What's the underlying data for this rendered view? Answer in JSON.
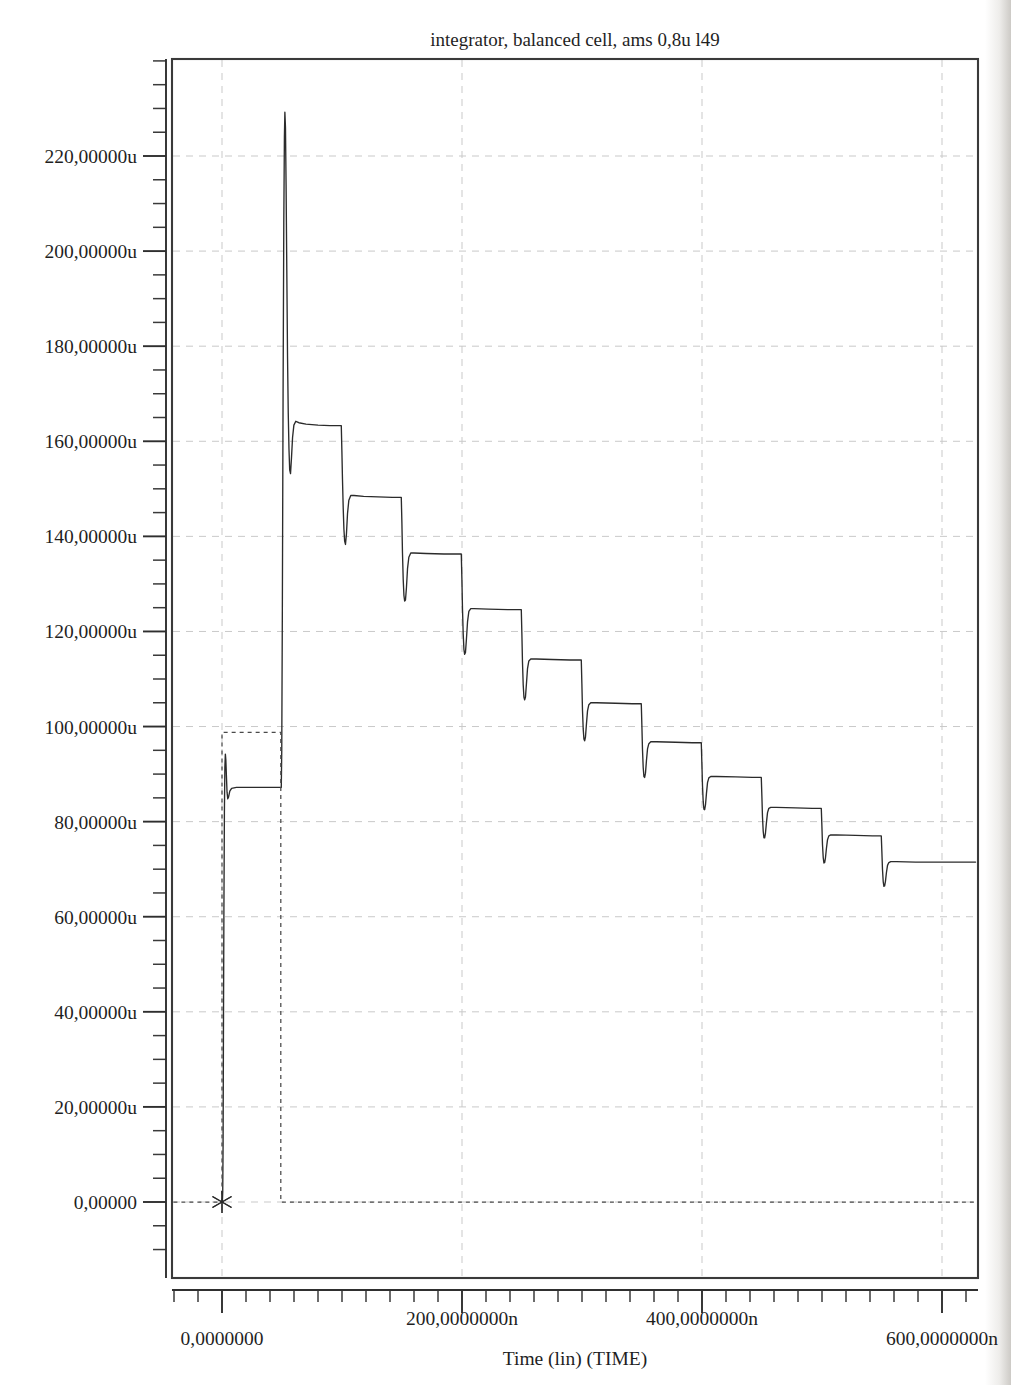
{
  "chart_data": {
    "type": "line",
    "title": "integrator, balanced cell,  ams 0,8u l49",
    "xlabel": "Time (lin) (TIME)",
    "ylabel": "",
    "xlim": [
      -42,
      630
    ],
    "ylim": [
      -14,
      243
    ],
    "x_unit": "n",
    "y_unit": "u",
    "grid": true,
    "legend": "none",
    "xticks": [
      0,
      200,
      400,
      600
    ],
    "xtick_labels": [
      "0,0000000",
      "200,0000000n",
      "400,0000000n",
      "600,0000000n"
    ],
    "x_minor_tick_step": 20,
    "yticks": [
      0,
      20,
      40,
      60,
      80,
      100,
      120,
      140,
      160,
      180,
      200,
      220
    ],
    "ytick_labels": [
      "0,00000",
      "20,00000u",
      "40,00000u",
      "60,00000u",
      "80,00000u",
      "100,00000u",
      "120,00000u",
      "140,00000u",
      "160,00000u",
      "180,00000u",
      "200,00000u",
      "220,00000u"
    ],
    "y_minor_tick_step": 5,
    "series": [
      {
        "name": "integrator-output",
        "style": "solid",
        "color": "#2b2b2b",
        "points": [
          [
            0,
            0
          ],
          [
            0,
            0
          ],
          [
            0.3,
            0.0
          ],
          [
            0.6,
            2.0
          ],
          [
            0.9,
            12.0
          ],
          [
            1.2,
            35.0
          ],
          [
            1.6,
            62.0
          ],
          [
            2.0,
            82.0
          ],
          [
            2.4,
            91.5
          ],
          [
            2.8,
            94.2
          ],
          [
            3.2,
            93.0
          ],
          [
            3.7,
            89.5
          ],
          [
            4.2,
            86.2
          ],
          [
            4.8,
            84.8
          ],
          [
            5.5,
            85.2
          ],
          [
            6.5,
            86.4
          ],
          [
            8.0,
            87.0
          ],
          [
            12.0,
            87.2
          ],
          [
            20.0,
            87.2
          ],
          [
            30.0,
            87.2
          ],
          [
            40.0,
            87.2
          ],
          [
            48.0,
            87.2
          ],
          [
            49.0,
            87.2
          ],
          [
            49.4,
            87.2
          ],
          [
            49.8,
            95.0
          ],
          [
            50.3,
            125.0
          ],
          [
            50.9,
            170.0
          ],
          [
            51.5,
            206.0
          ],
          [
            52.0,
            224.0
          ],
          [
            52.4,
            229.2
          ],
          [
            52.9,
            226.0
          ],
          [
            53.4,
            214.0
          ],
          [
            54.0,
            196.0
          ],
          [
            54.6,
            178.0
          ],
          [
            55.2,
            166.0
          ],
          [
            55.8,
            158.5
          ],
          [
            56.4,
            154.0
          ],
          [
            57.1,
            153.2
          ],
          [
            57.9,
            156.5
          ],
          [
            58.8,
            160.8
          ],
          [
            59.9,
            163.4
          ],
          [
            61.5,
            164.2
          ],
          [
            64.0,
            163.9
          ],
          [
            70.0,
            163.6
          ],
          [
            80.0,
            163.4
          ],
          [
            90.0,
            163.3
          ],
          [
            98.0,
            163.3
          ],
          [
            99.0,
            163.3
          ],
          [
            99.4,
            163.3
          ],
          [
            99.9,
            158.0
          ],
          [
            100.4,
            152.0
          ],
          [
            101.0,
            146.0
          ],
          [
            101.6,
            141.5
          ],
          [
            102.2,
            139.0
          ],
          [
            102.9,
            138.3
          ],
          [
            103.7,
            140.5
          ],
          [
            104.6,
            144.8
          ],
          [
            105.7,
            147.6
          ],
          [
            107.3,
            148.6
          ],
          [
            110.0,
            148.6
          ],
          [
            118.0,
            148.4
          ],
          [
            130.0,
            148.3
          ],
          [
            142.0,
            148.2
          ],
          [
            148.0,
            148.2
          ],
          [
            149.0,
            148.2
          ],
          [
            149.4,
            148.2
          ],
          [
            149.9,
            143.0
          ],
          [
            150.4,
            136.5
          ],
          [
            151.0,
            131.0
          ],
          [
            151.6,
            127.6
          ],
          [
            152.2,
            126.4
          ],
          [
            152.9,
            126.6
          ],
          [
            153.7,
            129.2
          ],
          [
            154.6,
            133.2
          ],
          [
            155.7,
            135.6
          ],
          [
            157.3,
            136.5
          ],
          [
            160.0,
            136.5
          ],
          [
            170.0,
            136.4
          ],
          [
            185.0,
            136.3
          ],
          [
            196.0,
            136.3
          ],
          [
            198.0,
            136.3
          ],
          [
            199.0,
            136.3
          ],
          [
            199.4,
            136.3
          ],
          [
            199.9,
            131.2
          ],
          [
            200.4,
            124.8
          ],
          [
            201.0,
            119.5
          ],
          [
            201.6,
            116.2
          ],
          [
            202.2,
            115.2
          ],
          [
            202.9,
            115.6
          ],
          [
            203.7,
            118.4
          ],
          [
            204.6,
            122.0
          ],
          [
            205.7,
            124.2
          ],
          [
            207.3,
            124.8
          ],
          [
            210.0,
            124.8
          ],
          [
            222.0,
            124.7
          ],
          [
            238.0,
            124.6
          ],
          [
            246.0,
            124.6
          ],
          [
            249.0,
            124.6
          ],
          [
            249.4,
            124.6
          ],
          [
            249.9,
            119.5
          ],
          [
            250.4,
            113.5
          ],
          [
            251.0,
            108.8
          ],
          [
            251.6,
            106.2
          ],
          [
            252.2,
            105.6
          ],
          [
            252.9,
            106.2
          ],
          [
            253.7,
            109.0
          ],
          [
            254.6,
            112.2
          ],
          [
            255.7,
            113.8
          ],
          [
            257.3,
            114.2
          ],
          [
            262.0,
            114.2
          ],
          [
            275.0,
            114.1
          ],
          [
            290.0,
            114.0
          ],
          [
            297.0,
            114.0
          ],
          [
            299.0,
            114.0
          ],
          [
            299.4,
            114.0
          ],
          [
            299.9,
            109.0
          ],
          [
            300.4,
            103.5
          ],
          [
            301.0,
            99.5
          ],
          [
            301.6,
            97.4
          ],
          [
            302.2,
            97.0
          ],
          [
            302.9,
            97.8
          ],
          [
            303.7,
            100.5
          ],
          [
            304.6,
            103.3
          ],
          [
            305.7,
            104.6
          ],
          [
            307.3,
            105.0
          ],
          [
            312.0,
            105.0
          ],
          [
            328.0,
            104.9
          ],
          [
            342.0,
            104.8
          ],
          [
            348.0,
            104.8
          ],
          [
            349.0,
            104.8
          ],
          [
            349.4,
            104.8
          ],
          [
            349.9,
            100.2
          ],
          [
            350.4,
            95.2
          ],
          [
            351.0,
            91.4
          ],
          [
            351.6,
            89.5
          ],
          [
            352.2,
            89.3
          ],
          [
            352.9,
            90.2
          ],
          [
            353.7,
            92.8
          ],
          [
            354.6,
            95.3
          ],
          [
            355.7,
            96.4
          ],
          [
            357.3,
            96.8
          ],
          [
            362.0,
            96.8
          ],
          [
            378.0,
            96.7
          ],
          [
            392.0,
            96.6
          ],
          [
            398.0,
            96.6
          ],
          [
            399.0,
            96.6
          ],
          [
            399.4,
            96.6
          ],
          [
            399.9,
            92.3
          ],
          [
            400.4,
            87.6
          ],
          [
            401.0,
            84.2
          ],
          [
            401.6,
            82.6
          ],
          [
            402.2,
            82.5
          ],
          [
            402.9,
            83.5
          ],
          [
            403.7,
            85.9
          ],
          [
            404.6,
            88.2
          ],
          [
            405.7,
            89.2
          ],
          [
            407.3,
            89.5
          ],
          [
            412.0,
            89.5
          ],
          [
            428.0,
            89.4
          ],
          [
            442.0,
            89.3
          ],
          [
            448.0,
            89.3
          ],
          [
            449.0,
            89.3
          ],
          [
            449.4,
            89.3
          ],
          [
            449.9,
            85.4
          ],
          [
            450.4,
            81.0
          ],
          [
            451.0,
            78.0
          ],
          [
            451.6,
            76.6
          ],
          [
            452.2,
            76.6
          ],
          [
            452.9,
            77.6
          ],
          [
            453.7,
            79.8
          ],
          [
            454.6,
            81.9
          ],
          [
            455.7,
            82.8
          ],
          [
            457.3,
            83.0
          ],
          [
            462.0,
            83.0
          ],
          [
            478.0,
            82.9
          ],
          [
            492.0,
            82.8
          ],
          [
            498.0,
            82.8
          ],
          [
            499.0,
            82.8
          ],
          [
            499.4,
            82.8
          ],
          [
            499.9,
            79.2
          ],
          [
            500.4,
            75.2
          ],
          [
            501.0,
            72.5
          ],
          [
            501.6,
            71.3
          ],
          [
            502.2,
            71.4
          ],
          [
            502.9,
            72.4
          ],
          [
            503.7,
            74.4
          ],
          [
            504.6,
            76.2
          ],
          [
            505.7,
            77.0
          ],
          [
            507.3,
            77.2
          ],
          [
            512.0,
            77.2
          ],
          [
            528.0,
            77.1
          ],
          [
            542.0,
            77.0
          ],
          [
            548.0,
            77.0
          ],
          [
            549.0,
            77.0
          ],
          [
            549.4,
            77.0
          ],
          [
            549.9,
            73.6
          ],
          [
            550.4,
            70.0
          ],
          [
            551.0,
            67.4
          ],
          [
            551.6,
            66.4
          ],
          [
            552.2,
            66.5
          ],
          [
            552.9,
            67.5
          ],
          [
            553.7,
            69.3
          ],
          [
            554.6,
            70.8
          ],
          [
            555.7,
            71.4
          ],
          [
            557.3,
            71.6
          ],
          [
            562.0,
            71.6
          ],
          [
            578.0,
            71.5
          ],
          [
            595.0,
            71.5
          ],
          [
            600.0,
            71.5
          ],
          [
            605.0,
            71.5
          ],
          [
            618.0,
            71.5
          ],
          [
            628.0,
            71.5
          ]
        ]
      },
      {
        "name": "reference-pulse",
        "style": "dashed",
        "color": "#4a4a4a",
        "points": [
          [
            -40.5,
            0
          ],
          [
            0,
            0
          ],
          [
            0,
            98.8
          ],
          [
            49.0,
            98.8
          ],
          [
            49.0,
            0
          ],
          [
            628,
            0
          ]
        ]
      }
    ],
    "annotations": [
      {
        "name": "origin-marker",
        "kind": "asterisk-marker",
        "x": 0,
        "y": 0
      }
    ]
  },
  "figure": {
    "title": "integrator, balanced cell,  ams 0,8u l49",
    "background_color": "#ffffff",
    "frame_color": "#3a3a3a",
    "grid_color": "#c9c9c9",
    "trace_color": "#2b2b2b"
  }
}
